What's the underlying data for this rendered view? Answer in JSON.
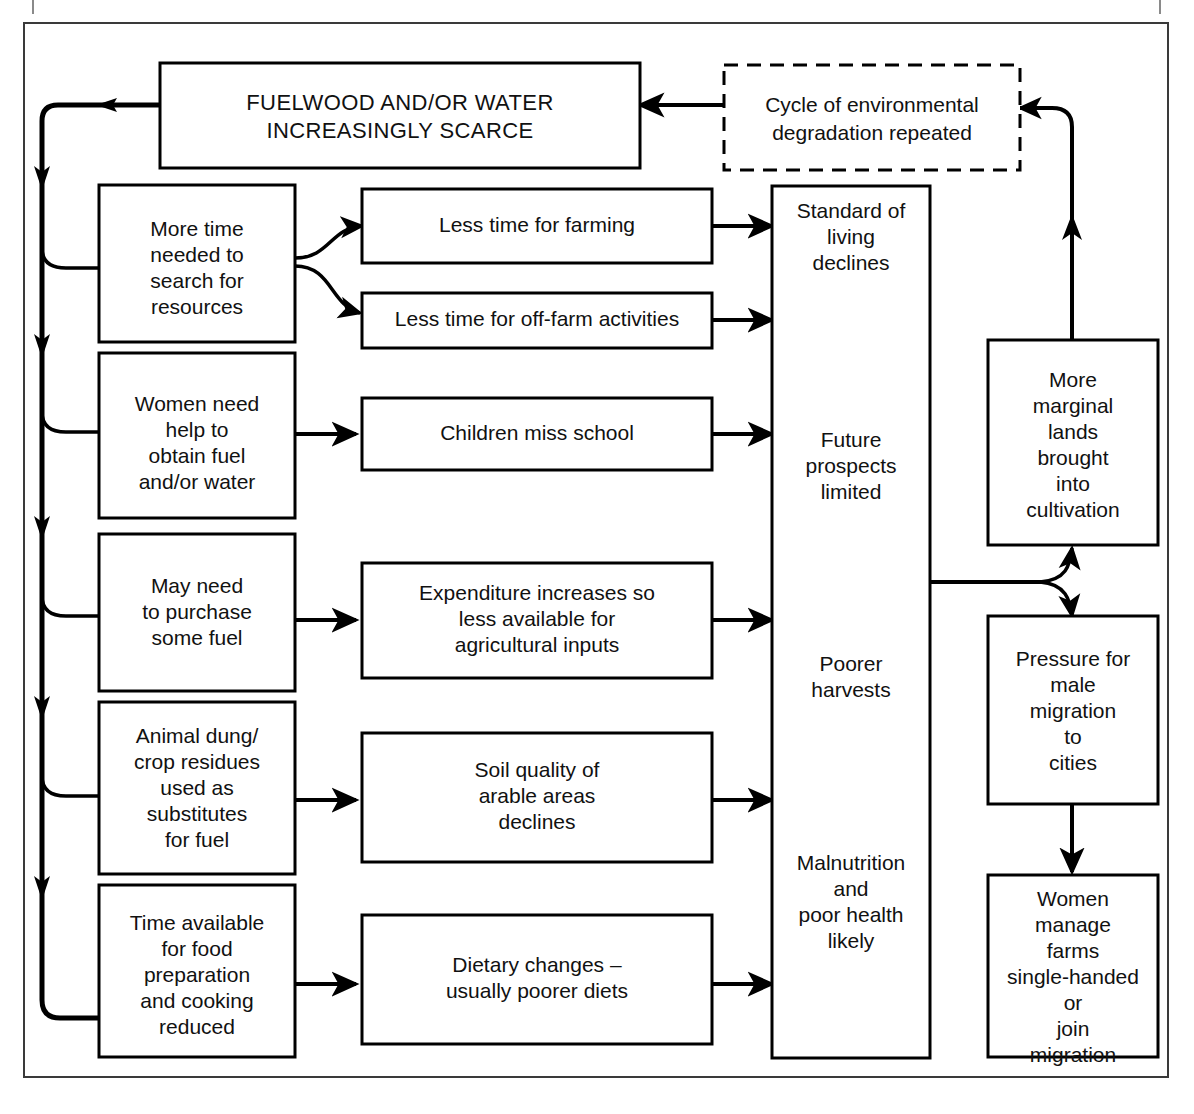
{
  "diagram": {
    "type": "flowchart",
    "title_node": "FUELWOOD AND/OR WATER INCREASINGLY SCARCE",
    "nodes": {
      "scarce": {
        "id": "scarce",
        "label_line1": "FUELWOOD AND/OR WATER",
        "label_line2": "INCREASINGLY SCARCE",
        "style": "solid",
        "uppercase": true
      },
      "cycle": {
        "id": "cycle",
        "label_line1": "Cycle of environmental",
        "label_line2": "degradation repeated",
        "style": "dashed",
        "uppercase": false
      },
      "more_time": {
        "id": "more_time",
        "lines": [
          "More time",
          "needed to",
          "search for",
          "resources"
        ],
        "style": "solid"
      },
      "women_help": {
        "id": "women_help",
        "lines": [
          "Women need",
          "help to",
          "obtain fuel",
          "and/or water"
        ],
        "style": "solid"
      },
      "may_purchase": {
        "id": "may_purchase",
        "lines": [
          "May need",
          "to purchase",
          "some fuel"
        ],
        "style": "solid"
      },
      "animal_dung": {
        "id": "animal_dung",
        "lines": [
          "Animal dung/",
          "crop residues",
          "used as",
          "substitutes",
          "for fuel"
        ],
        "style": "solid"
      },
      "time_food": {
        "id": "time_food",
        "lines": [
          "Time available",
          "for food",
          "preparation",
          "and cooking",
          "reduced"
        ],
        "style": "solid"
      },
      "less_farming": {
        "id": "less_farming",
        "lines": [
          "Less time for farming"
        ],
        "style": "solid"
      },
      "less_offfarm": {
        "id": "less_offfarm",
        "lines": [
          "Less time for off-farm activities"
        ],
        "style": "solid"
      },
      "children_school": {
        "id": "children_school",
        "lines": [
          "Children miss school"
        ],
        "style": "solid"
      },
      "expenditure": {
        "id": "expenditure",
        "lines": [
          "Expenditure increases so",
          "less available for",
          "agricultural inputs"
        ],
        "style": "solid"
      },
      "soil_quality": {
        "id": "soil_quality",
        "lines": [
          "Soil quality of",
          "arable areas",
          "declines"
        ],
        "style": "solid"
      },
      "dietary": {
        "id": "dietary",
        "lines": [
          "Dietary changes –",
          "usually poorer diets"
        ],
        "style": "solid"
      },
      "outcomes": {
        "id": "outcomes",
        "style": "solid",
        "groups": [
          {
            "lines": [
              "Standard of",
              "living",
              "declines"
            ]
          },
          {
            "lines": [
              "Future",
              "prospects",
              "limited"
            ]
          },
          {
            "lines": [
              "Poorer",
              "harvests"
            ]
          },
          {
            "lines": [
              "Malnutrition",
              "and",
              "poor health",
              "likely"
            ]
          }
        ]
      },
      "marginal_lands": {
        "id": "marginal_lands",
        "lines": [
          "More",
          "marginal",
          "lands",
          "brought",
          "into",
          "cultivation"
        ],
        "style": "solid"
      },
      "male_migration": {
        "id": "male_migration",
        "lines": [
          "Pressure for",
          "male",
          "migration",
          "to",
          "cities"
        ],
        "style": "solid"
      },
      "women_farms": {
        "id": "women_farms",
        "lines": [
          "Women",
          "manage",
          "farms",
          "single-handed",
          "or",
          "join",
          "migration"
        ],
        "style": "solid"
      }
    },
    "edges": [
      {
        "from": "cycle",
        "to": "scarce",
        "kind": "straight-left"
      },
      {
        "from": "scarce",
        "to": "left-trunk",
        "kind": "loop-left"
      },
      {
        "from": "left-trunk",
        "to": "more_time",
        "kind": "branch-right"
      },
      {
        "from": "left-trunk",
        "to": "women_help",
        "kind": "branch-right"
      },
      {
        "from": "left-trunk",
        "to": "may_purchase",
        "kind": "branch-right"
      },
      {
        "from": "left-trunk",
        "to": "animal_dung",
        "kind": "branch-right"
      },
      {
        "from": "left-trunk",
        "to": "time_food",
        "kind": "branch-right"
      },
      {
        "from": "more_time",
        "to": "less_farming",
        "kind": "fork-curve-up"
      },
      {
        "from": "more_time",
        "to": "less_offfarm",
        "kind": "fork-curve-down"
      },
      {
        "from": "women_help",
        "to": "children_school",
        "kind": "straight-right"
      },
      {
        "from": "may_purchase",
        "to": "expenditure",
        "kind": "straight-right"
      },
      {
        "from": "animal_dung",
        "to": "soil_quality",
        "kind": "straight-right"
      },
      {
        "from": "time_food",
        "to": "dietary",
        "kind": "straight-right"
      },
      {
        "from": "less_farming",
        "to": "outcomes",
        "kind": "straight-right"
      },
      {
        "from": "less_offfarm",
        "to": "outcomes",
        "kind": "straight-right"
      },
      {
        "from": "children_school",
        "to": "outcomes",
        "kind": "straight-right"
      },
      {
        "from": "expenditure",
        "to": "outcomes",
        "kind": "straight-right"
      },
      {
        "from": "soil_quality",
        "to": "outcomes",
        "kind": "straight-right"
      },
      {
        "from": "dietary",
        "to": "outcomes",
        "kind": "straight-right"
      },
      {
        "from": "outcomes",
        "to": "marginal_lands",
        "kind": "fork-curve-up"
      },
      {
        "from": "outcomes",
        "to": "male_migration",
        "kind": "fork-curve-down"
      },
      {
        "from": "male_migration",
        "to": "women_farms",
        "kind": "straight-down"
      },
      {
        "from": "marginal_lands",
        "to": "cycle",
        "kind": "loop-right-up"
      }
    ]
  }
}
